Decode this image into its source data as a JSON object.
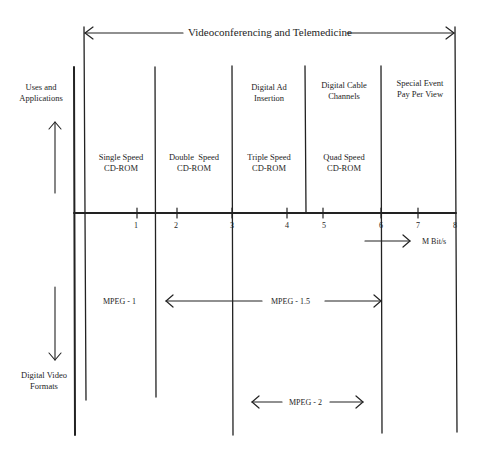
{
  "diagram": {
    "top_span": {
      "label": "Videoconferencing and Telemedicine"
    },
    "left_axis": {
      "up_label": "Uses and Applications",
      "up_label_lines": [
        "Uses and",
        "Applications"
      ],
      "down_label_lines": [
        "Digital Video",
        "Formats"
      ]
    },
    "x_axis": {
      "unit": "M Bit/s",
      "ticks": [
        "1",
        "2",
        "3",
        "4",
        "5",
        "6",
        "7",
        "8"
      ]
    },
    "applications": [
      {
        "lines": [
          "Digital Ad",
          "Insertion"
        ]
      },
      {
        "lines": [
          "Digital Cable",
          "Channels"
        ]
      },
      {
        "lines": [
          "Special Event",
          "Pay Per View"
        ]
      }
    ],
    "cdrom": [
      {
        "lines": [
          "Single Speed",
          "CD-ROM"
        ]
      },
      {
        "lines": [
          "Double  Speed",
          "CD-ROM"
        ]
      },
      {
        "lines": [
          "Triple Speed",
          "CD-ROM"
        ]
      },
      {
        "lines": [
          "Quad Speed",
          "CD-ROM"
        ]
      }
    ],
    "formats": [
      {
        "label": "MPEG - 1"
      },
      {
        "label": "MPEG - 1.5"
      },
      {
        "label": "MPEG - 2"
      }
    ]
  }
}
